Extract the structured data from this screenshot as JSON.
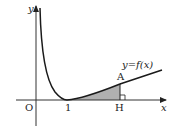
{
  "diagram": {
    "type": "function-graph",
    "axis_labels": {
      "x": "x",
      "y": "y",
      "origin": "O"
    },
    "tick_labels": {
      "one": "1",
      "H": "H"
    },
    "point_labels": {
      "A": "A"
    },
    "curve_label": "y=f(x)",
    "colors": {
      "line": "#1a1a1a",
      "axis": "#333333",
      "shade": "#b0b0b0"
    },
    "shaded_region": "area under y=f(x) from x=1 to x=H",
    "right_angle_marker_at": "H"
  }
}
